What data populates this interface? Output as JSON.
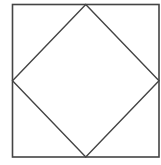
{
  "diagram": {
    "stroke_color": "#444444",
    "background": "#ffffff",
    "outer_square": {
      "x": 12.5,
      "y": 4.5,
      "width": 146.5,
      "height": 152.5
    },
    "inner_diamond": {
      "points": "85.75,4.5 159,80.75 85.75,157 12.5,80.75"
    }
  }
}
